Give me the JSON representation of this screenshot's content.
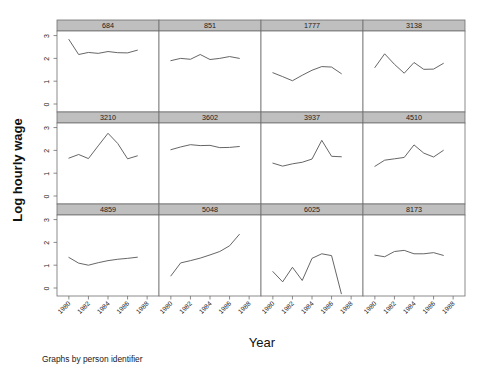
{
  "figure": {
    "title": "",
    "note": "Graphs by person identifier",
    "xlabel": "Year",
    "ylabel": "Log hourly wage",
    "background_color": "#ffffff",
    "strip_color": "#bfbfbf",
    "line_color": "#555555",
    "frame_color": "#6f6f6f"
  },
  "chart_data": {
    "type": "line",
    "title": "",
    "subtitle": "",
    "xlabel": "Year",
    "ylabel": "Log hourly wage",
    "note": "Graphs by person identifier",
    "layout": {
      "rows": 3,
      "cols": 4,
      "shared_x": true,
      "shared_y": true,
      "grid": false,
      "legend": "none",
      "panel_strip_position": "top"
    },
    "xlim": [
      1979.4,
      1988.6
    ],
    "ylim": [
      -0.35,
      3.2
    ],
    "xticks": [
      1980,
      1982,
      1984,
      1986,
      1988
    ],
    "xtick_labels": [
      "1980",
      "1982",
      "1984",
      "1986",
      "1988"
    ],
    "xtick_label_rotation": -45,
    "yticks": [
      0,
      1,
      2,
      3
    ],
    "ytick_labels": [
      "0",
      "1",
      "2",
      "3"
    ],
    "ytick_label_rotation": -90,
    "x": [
      1980,
      1981,
      1982,
      1983,
      1984,
      1985,
      1986,
      1987
    ],
    "panels": [
      {
        "title": "684",
        "row": 0,
        "col": 0,
        "x": [
          1980,
          1981,
          1982,
          1983,
          1984,
          1985,
          1986,
          1987
        ],
        "values": [
          2.83,
          2.17,
          2.26,
          2.22,
          2.3,
          2.25,
          2.24,
          2.36
        ]
      },
      {
        "title": "851",
        "row": 0,
        "col": 1,
        "x": [
          1980,
          1981,
          1982,
          1983,
          1984,
          1985,
          1986,
          1987
        ],
        "values": [
          1.9,
          2.0,
          1.96,
          2.17,
          1.95,
          2.0,
          2.08,
          2.0
        ]
      },
      {
        "title": "1777",
        "row": 0,
        "col": 2,
        "x": [
          1980,
          1981,
          1982,
          1983,
          1984,
          1985,
          1986,
          1987
        ],
        "values": [
          1.37,
          1.2,
          1.02,
          1.26,
          1.48,
          1.64,
          1.62,
          1.33
        ]
      },
      {
        "title": "3138",
        "row": 0,
        "col": 3,
        "x": [
          1980,
          1981,
          1982,
          1983,
          1984,
          1985,
          1986,
          1987
        ],
        "values": [
          1.6,
          2.2,
          1.74,
          1.35,
          1.82,
          1.52,
          1.53,
          1.78
        ]
      },
      {
        "title": "3210",
        "row": 1,
        "col": 0,
        "x": [
          1980,
          1981,
          1982,
          1983,
          1984,
          1985,
          1986,
          1987
        ],
        "values": [
          1.66,
          1.82,
          1.64,
          2.2,
          2.75,
          2.3,
          1.63,
          1.76
        ]
      },
      {
        "title": "3602",
        "row": 1,
        "col": 1,
        "x": [
          1980,
          1981,
          1982,
          1983,
          1984,
          1985,
          1986,
          1987
        ],
        "values": [
          2.03,
          2.15,
          2.25,
          2.21,
          2.22,
          2.12,
          2.13,
          2.17
        ]
      },
      {
        "title": "3937",
        "row": 1,
        "col": 2,
        "x": [
          1980,
          1981,
          1982,
          1983,
          1984,
          1985,
          1986,
          1987
        ],
        "values": [
          1.44,
          1.31,
          1.41,
          1.48,
          1.62,
          2.44,
          1.74,
          1.72
        ]
      },
      {
        "title": "4510",
        "row": 1,
        "col": 3,
        "x": [
          1980,
          1981,
          1982,
          1983,
          1984,
          1985,
          1986,
          1987
        ],
        "values": [
          1.3,
          1.57,
          1.63,
          1.69,
          2.24,
          1.88,
          1.71,
          2.0
        ]
      },
      {
        "title": "4859",
        "row": 2,
        "col": 0,
        "x": [
          1980,
          1981,
          1982,
          1983,
          1984,
          1985,
          1986,
          1987
        ],
        "values": [
          1.34,
          1.09,
          1.0,
          1.11,
          1.2,
          1.26,
          1.3,
          1.35
        ]
      },
      {
        "title": "5048",
        "row": 2,
        "col": 1,
        "x": [
          1980,
          1981,
          1982,
          1983,
          1984,
          1985,
          1986,
          1987
        ],
        "values": [
          0.53,
          1.1,
          1.2,
          1.31,
          1.45,
          1.6,
          1.85,
          2.35
        ]
      },
      {
        "title": "6025",
        "row": 2,
        "col": 2,
        "x": [
          1980,
          1981,
          1982,
          1983,
          1984,
          1985,
          1986,
          1987
        ],
        "values": [
          0.72,
          0.27,
          0.91,
          0.33,
          1.3,
          1.5,
          1.42,
          -0.25
        ]
      },
      {
        "title": "8173",
        "row": 2,
        "col": 3,
        "x": [
          1980,
          1981,
          1982,
          1983,
          1984,
          1985,
          1986,
          1987
        ],
        "values": [
          1.44,
          1.37,
          1.6,
          1.65,
          1.5,
          1.5,
          1.55,
          1.43
        ]
      }
    ]
  }
}
